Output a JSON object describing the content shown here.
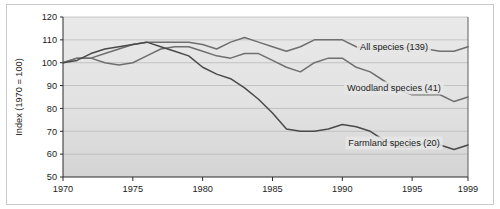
{
  "chart_data": {
    "type": "line",
    "title": "",
    "subtitle": "",
    "xlabel": "",
    "ylabel": "Index (1970 = 100)",
    "xlim": [
      1970,
      1999
    ],
    "ylim": [
      50,
      120
    ],
    "grid": "horizontal",
    "legend_position": "inline-right",
    "x_tick_labels": [
      "1970",
      "1975",
      "1980",
      "1985",
      "1990",
      "1995",
      "1999"
    ],
    "x_ticks": [
      1970,
      1975,
      1980,
      1985,
      1990,
      1995,
      1999
    ],
    "y_tick_labels": [
      "50",
      "60",
      "70",
      "80",
      "90",
      "100",
      "110",
      "120"
    ],
    "y_ticks": [
      50,
      60,
      70,
      80,
      90,
      100,
      110,
      120
    ],
    "x": [
      1970,
      1971,
      1972,
      1973,
      1974,
      1975,
      1976,
      1977,
      1978,
      1979,
      1980,
      1981,
      1982,
      1983,
      1984,
      1985,
      1986,
      1987,
      1988,
      1989,
      1990,
      1991,
      1992,
      1993,
      1994,
      1995,
      1996,
      1997,
      1998,
      1999
    ],
    "series": [
      {
        "name": "All species (139)",
        "label": "All species (139)",
        "count": 139,
        "color": "#6f6f6f",
        "values": [
          100,
          102,
          102,
          104,
          106,
          108,
          109,
          109,
          109,
          109,
          108,
          106,
          109,
          111,
          109,
          107,
          105,
          107,
          110,
          110,
          110,
          107,
          106,
          106,
          106,
          107,
          106,
          105,
          105,
          107
        ]
      },
      {
        "name": "Woodland species (41)",
        "label": "Woodland species (41)",
        "count": 41,
        "color": "#6f6f6f",
        "values": [
          100,
          102,
          102,
          100,
          99,
          100,
          103,
          106,
          107,
          107,
          105,
          103,
          102,
          104,
          104,
          101,
          98,
          96,
          100,
          102,
          102,
          98,
          96,
          92,
          88,
          86,
          86,
          86,
          83,
          85
        ]
      },
      {
        "name": "Farmland species (20)",
        "label": "Farmland species (20)",
        "count": 20,
        "color": "#4a4a4a",
        "values": [
          100,
          101,
          104,
          106,
          107,
          108,
          109,
          107,
          105,
          103,
          98,
          95,
          93,
          89,
          84,
          78,
          71,
          70,
          70,
          71,
          73,
          72,
          70,
          66,
          63,
          63,
          65,
          64,
          62,
          64
        ]
      }
    ]
  },
  "axes": {
    "y_axis_title": "Index (1970 = 100)"
  }
}
